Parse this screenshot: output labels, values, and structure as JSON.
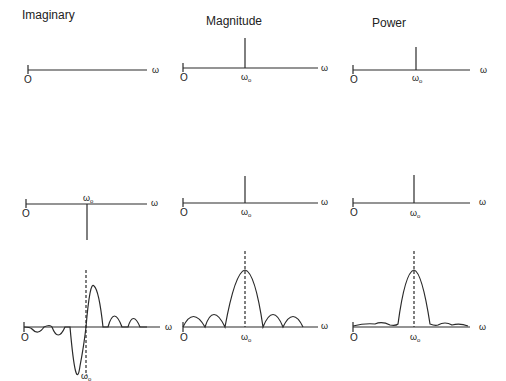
{
  "columns": [
    {
      "title": "Imaginary"
    },
    {
      "title": "Magnitude"
    },
    {
      "title": "Power"
    }
  ],
  "axis": {
    "origin_label": "O",
    "x_label": "ω",
    "center_label": "ω",
    "center_sub": "o"
  },
  "rows": [
    {
      "name": "row-1",
      "description": "Imaginary zero; Magnitude and Power impulse at ω0"
    },
    {
      "name": "row-2",
      "description": "Imaginary negative impulse at ω0; Magnitude and Power positive impulse at ω0"
    },
    {
      "name": "row-3",
      "description": "Windowed spectra: imaginary odd sinc-like, magnitude |sinc|, power sinc²"
    }
  ],
  "colors": {
    "line": "#2a2a2a",
    "background": "#ffffff"
  }
}
